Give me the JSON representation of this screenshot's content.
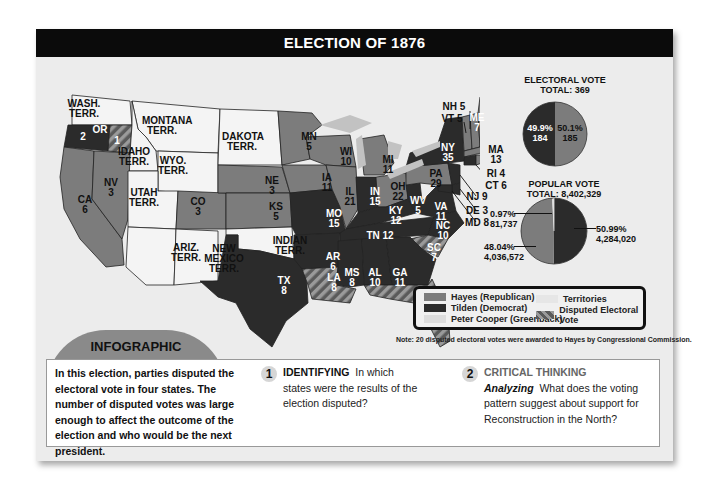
{
  "header": {
    "title": "ELECTION OF 1876"
  },
  "map": {
    "labels": [
      {
        "id": "WA",
        "text": "WASH.\nTERR.",
        "x": 34,
        "y": 10,
        "white": false
      },
      {
        "id": "OR",
        "text": "OR",
        "x": 50,
        "y": 36,
        "white": true
      },
      {
        "id": "OR_votes_a",
        "text": "2",
        "x": 33,
        "y": 43,
        "white": true
      },
      {
        "id": "OR_votes_b",
        "text": "1",
        "x": 67,
        "y": 47,
        "white": true
      },
      {
        "id": "MT",
        "text": "MONTANA\nTERR.",
        "x": 112,
        "y": 27,
        "white": false
      },
      {
        "id": "ID",
        "text": "IDAHO\nTERR.",
        "x": 84,
        "y": 58,
        "white": false
      },
      {
        "id": "WY",
        "text": "WYO.\nTERR.",
        "x": 123,
        "y": 67,
        "white": false
      },
      {
        "id": "DK",
        "text": "DAKOTA\nTERR.",
        "x": 192,
        "y": 43,
        "white": false
      },
      {
        "id": "MN",
        "text": "MN\n5",
        "x": 259,
        "y": 43,
        "white": false
      },
      {
        "id": "WI",
        "text": "WI\n10",
        "x": 296,
        "y": 58,
        "white": false
      },
      {
        "id": "MI",
        "text": "MI\n11",
        "x": 338,
        "y": 66,
        "white": false
      },
      {
        "id": "NV",
        "text": "NV\n3",
        "x": 61,
        "y": 89,
        "white": false
      },
      {
        "id": "UT",
        "text": "UTAH\nTERR.",
        "x": 94,
        "y": 99,
        "white": false
      },
      {
        "id": "CA",
        "text": "CA\n6",
        "x": 35,
        "y": 106,
        "white": false
      },
      {
        "id": "CO",
        "text": "CO\n3",
        "x": 148,
        "y": 108,
        "white": false
      },
      {
        "id": "NE",
        "text": "NE\n3",
        "x": 222,
        "y": 87,
        "white": false
      },
      {
        "id": "KS",
        "text": "KS\n5",
        "x": 226,
        "y": 113,
        "white": false
      },
      {
        "id": "IA",
        "text": "IA\n11",
        "x": 277,
        "y": 84,
        "white": false
      },
      {
        "id": "IL",
        "text": "IL\n21",
        "x": 300,
        "y": 98,
        "white": false
      },
      {
        "id": "IN",
        "text": "IN\n15",
        "x": 325,
        "y": 98,
        "white": true
      },
      {
        "id": "OH",
        "text": "OH\n22",
        "x": 348,
        "y": 93,
        "white": false
      },
      {
        "id": "PA",
        "text": "PA\n29",
        "x": 386,
        "y": 80,
        "white": false
      },
      {
        "id": "NY",
        "text": "NY\n35",
        "x": 398,
        "y": 54,
        "white": true
      },
      {
        "id": "MO",
        "text": "MO\n15",
        "x": 284,
        "y": 120,
        "white": true
      },
      {
        "id": "KY",
        "text": "KY\n12",
        "x": 346,
        "y": 117,
        "white": true
      },
      {
        "id": "WV",
        "text": "WV\n5",
        "x": 368,
        "y": 107,
        "white": true
      },
      {
        "id": "VA",
        "text": "VA\n11",
        "x": 391,
        "y": 113,
        "white": true
      },
      {
        "id": "NC",
        "text": "NC\n10",
        "x": 393,
        "y": 132,
        "white": true
      },
      {
        "id": "TN",
        "text": "TN 12",
        "x": 330,
        "y": 142,
        "white": true
      },
      {
        "id": "AZ",
        "text": "ARIZ.\nTERR.",
        "x": 136,
        "y": 154,
        "white": false
      },
      {
        "id": "NM",
        "text": "NEW\nMEXICO\nTERR.",
        "x": 174,
        "y": 155,
        "white": false
      },
      {
        "id": "IT",
        "text": "INDIAN\nTERR.",
        "x": 240,
        "y": 147,
        "white": false
      },
      {
        "id": "AR",
        "text": "AR\n6",
        "x": 283,
        "y": 163,
        "white": true
      },
      {
        "id": "SC",
        "text": "SC\n7",
        "x": 384,
        "y": 154,
        "white": true
      },
      {
        "id": "MS",
        "text": "MS\n8",
        "x": 302,
        "y": 179,
        "white": true
      },
      {
        "id": "AL",
        "text": "AL\n10",
        "x": 325,
        "y": 179,
        "white": true
      },
      {
        "id": "GA",
        "text": "GA\n11",
        "x": 350,
        "y": 179,
        "white": true
      },
      {
        "id": "TX",
        "text": "TX\n8",
        "x": 234,
        "y": 187,
        "white": true
      },
      {
        "id": "LA",
        "text": "LA\n8",
        "x": 284,
        "y": 184,
        "white": true
      },
      {
        "id": "FL",
        "text": "FL\n4",
        "x": 371,
        "y": 212,
        "white": true
      },
      {
        "id": "NH",
        "text": "NH 5",
        "x": 404,
        "y": 13,
        "white": false
      },
      {
        "id": "VT",
        "text": "VT 5",
        "x": 402,
        "y": 25,
        "white": false
      },
      {
        "id": "ME",
        "text": "ME\n7",
        "x": 427,
        "y": 24,
        "white": true
      },
      {
        "id": "MA",
        "text": "MA\n13",
        "x": 446,
        "y": 56,
        "white": false
      },
      {
        "id": "RI",
        "text": "RI 4",
        "x": 446,
        "y": 80,
        "white": false
      },
      {
        "id": "CT",
        "text": "CT 6",
        "x": 446,
        "y": 92,
        "white": false
      },
      {
        "id": "NJ",
        "text": "NJ 9",
        "x": 427,
        "y": 103,
        "white": false
      },
      {
        "id": "DE",
        "text": "DE 3",
        "x": 427,
        "y": 117,
        "white": false
      },
      {
        "id": "MD",
        "text": "MD 8",
        "x": 427,
        "y": 129,
        "white": false
      }
    ]
  },
  "chart_data": [
    {
      "type": "pie",
      "title": "ELECTORAL VOTE",
      "subtitle": "TOTAL: 369",
      "categories": [
        "Tilden (Democrat)",
        "Hayes (Republican)"
      ],
      "values": [
        184,
        185
      ],
      "percent_labels": [
        "49.9%",
        "50.1%"
      ],
      "value_labels": [
        "184",
        "185"
      ],
      "colors": [
        "#2b2b2b",
        "#7c7c7c"
      ]
    },
    {
      "type": "pie",
      "title": "POPULAR VOTE",
      "subtitle": "TOTAL: 8,402,329",
      "categories": [
        "Tilden (Democrat)",
        "Hayes (Republican)",
        "Peter Cooper (Greenback)"
      ],
      "values": [
        4284020,
        4036572,
        81737
      ],
      "percent_labels": [
        "50.99%",
        "48.04%",
        "0.97%"
      ],
      "value_labels": [
        "4,284,020",
        "4,036,572",
        "81,737"
      ],
      "colors": [
        "#2b2b2b",
        "#7c7c7c",
        "#d8d8d8"
      ]
    }
  ],
  "pies": {
    "electoral": {
      "title": "ELECTORAL VOTE",
      "total": "TOTAL: 369",
      "dem_pct": "49.9%",
      "dem_val": "184",
      "rep_pct": "50.1%",
      "rep_val": "185"
    },
    "popular": {
      "title": "POPULAR VOTE",
      "total": "TOTAL: 8,402,329",
      "dem_pct": "50.99%",
      "dem_val": "4,284,020",
      "rep_pct": "48.04%",
      "rep_val": "4,036,572",
      "gb_pct": "0.97%",
      "gb_val": "81,737"
    }
  },
  "legend": {
    "items": [
      {
        "label": "Hayes (Republican)",
        "color": "#7c7c7c"
      },
      {
        "label": "Tilden (Democrat)",
        "color": "#2b2b2b"
      },
      {
        "label": "Peter Cooper (Greenback)",
        "color": "#dcdcdc"
      },
      {
        "label": "Territories",
        "color": "#e6e6e6"
      },
      {
        "label": "Disputed Electoral Vote",
        "color": "striped"
      }
    ]
  },
  "note": "Note: 20 disputed electoral votes were awarded to Hayes by Congressional Commission.",
  "badge": {
    "label": "INFOGRAPHIC"
  },
  "intro": "In this election, parties disputed the electoral vote in four states. The number of disputed votes was large enough to affect the outcome of the election and who would be the next president.",
  "questions": [
    {
      "number": "1",
      "heading": "IDENTIFYING",
      "skill": "",
      "text": "In which states were the results of the election disputed?"
    },
    {
      "number": "2",
      "heading": "CRITICAL THINKING",
      "skill": "Analyzing",
      "text": "What does the voting pattern suggest about support for Reconstruction in the North?"
    }
  ],
  "colors": {
    "republican": "#7c7c7c",
    "democrat": "#2b2b2b",
    "greenback": "#dcdcdc",
    "territory": "#f4f4f4",
    "header": "#0b0b0b"
  }
}
